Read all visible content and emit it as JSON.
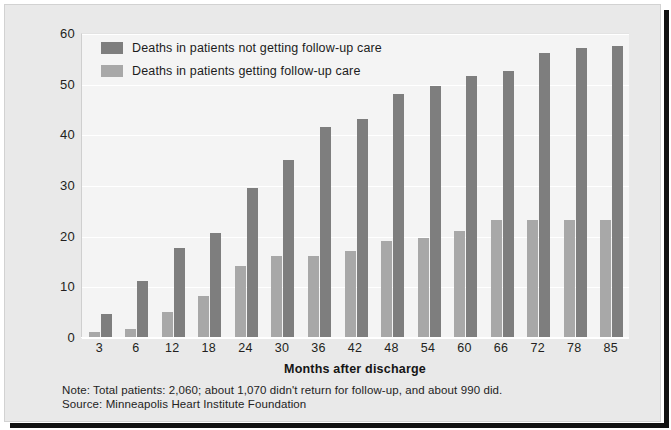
{
  "chart_data": {
    "type": "bar",
    "title": "",
    "xlabel": "Months after discharge",
    "ylabel": "",
    "ylim": [
      0,
      60
    ],
    "yticks": [
      0,
      10,
      20,
      30,
      40,
      50,
      60
    ],
    "grid": true,
    "legend_position": "top-left",
    "categories": [
      "3",
      "6",
      "12",
      "18",
      "24",
      "30",
      "36",
      "42",
      "48",
      "54",
      "60",
      "66",
      "72",
      "78",
      "85"
    ],
    "series": [
      {
        "name": "Deaths in patients getting follow-up care",
        "color": "#a8a8a8",
        "values": [
          1,
          1.5,
          5,
          8,
          14,
          16,
          16,
          17,
          19,
          19.5,
          21,
          23,
          23,
          23,
          23
        ]
      },
      {
        "name": "Deaths in patients not getting follow-up care",
        "color": "#7e7e7e",
        "values": [
          4.5,
          11,
          17.5,
          20.5,
          29.5,
          35,
          41.5,
          43,
          48,
          49.5,
          51.5,
          52.5,
          56,
          57,
          57.5
        ]
      }
    ],
    "annotations": [
      "Note: Total patients: 2,060; about 1,070 didn't return for follow-up, and about 990 did.",
      "Source: Minneapolis Heart Institute Foundation"
    ]
  },
  "legend": {
    "entries": [
      {
        "label": "Deaths in patients not getting follow-up care",
        "color": "#7e7e7e"
      },
      {
        "label": "Deaths in patients getting follow-up care",
        "color": "#a8a8a8"
      }
    ]
  },
  "axis": {
    "x_title": "Months after discharge",
    "y_ticks": [
      "60",
      "50",
      "40",
      "30",
      "20",
      "10",
      "0"
    ],
    "x_ticks": [
      "3",
      "6",
      "12",
      "18",
      "24",
      "30",
      "36",
      "42",
      "48",
      "54",
      "60",
      "66",
      "72",
      "78",
      "85"
    ]
  },
  "footnote": {
    "note": "Note: Total patients: 2,060; about 1,070 didn't return for follow-up, and about 990 did.",
    "source": "Source: Minneapolis Heart Institute Foundation"
  },
  "colors": {
    "bar_light": "#a8a8a8",
    "bar_dark": "#7e7e7e",
    "plot_background": "#f4f4f4",
    "card_background": "#e9e9e9",
    "gridline": "#ffffff"
  }
}
